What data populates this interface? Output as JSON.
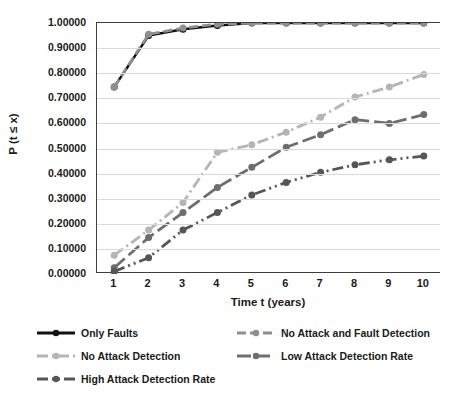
{
  "chart_data": {
    "type": "line",
    "title": "",
    "xlabel": "Time t (years)",
    "ylabel": "P (t ≤ x)",
    "grid": true,
    "legend_position": "bottom",
    "x": [
      1,
      2,
      3,
      4,
      5,
      6,
      7,
      8,
      9,
      10
    ],
    "xtick_labels": [
      "1",
      "2",
      "3",
      "4",
      "5",
      "6",
      "7",
      "8",
      "9",
      "10"
    ],
    "xlim": [
      0.5,
      10.5
    ],
    "ylim": [
      0.0,
      1.0
    ],
    "ytick_labels": [
      "1.00000",
      "0.90000",
      "0.80000",
      "0.70000",
      "0.60000",
      "0.50000",
      "0.40000",
      "0.30000",
      "0.20000",
      "0.10000",
      "0.00000"
    ],
    "ytick_values": [
      1.0,
      0.9,
      0.8,
      0.7,
      0.6,
      0.5,
      0.4,
      0.3,
      0.2,
      0.1,
      0.0
    ],
    "series": [
      {
        "name": "Only Faults",
        "color": "#111111",
        "dash": "none",
        "marker": "circle",
        "values": [
          0.745,
          0.95,
          0.975,
          0.99,
          1.0,
          1.0,
          1.0,
          1.0,
          1.0,
          1.0
        ]
      },
      {
        "name": "No Attack and Fault Detection",
        "color": "#8f8f8f",
        "dash": "dashed",
        "marker": "circle",
        "values": [
          0.745,
          0.955,
          0.98,
          0.995,
          1.0,
          1.0,
          1.0,
          1.0,
          1.0,
          1.0
        ]
      },
      {
        "name": "No Attack Detection",
        "color": "#b5b5b5",
        "dash": "dashdot",
        "marker": "circle",
        "values": [
          0.075,
          0.175,
          0.285,
          0.485,
          0.515,
          0.565,
          0.625,
          0.705,
          0.745,
          0.795
        ]
      },
      {
        "name": "Low Attack Detection Rate",
        "color": "#6e6e6e",
        "dash": "longdash",
        "marker": "circle",
        "values": [
          0.025,
          0.145,
          0.245,
          0.345,
          0.425,
          0.505,
          0.555,
          0.615,
          0.6,
          0.635
        ]
      },
      {
        "name": "High Attack Detection Rate",
        "color": "#565656",
        "dash": "dashdotdot",
        "marker": "circle",
        "values": [
          0.01,
          0.065,
          0.175,
          0.245,
          0.315,
          0.365,
          0.405,
          0.435,
          0.455,
          0.47
        ]
      }
    ]
  },
  "legend": {
    "items": [
      {
        "label": "Only Faults"
      },
      {
        "label": "No Attack and Fault Detection"
      },
      {
        "label": "No Attack Detection"
      },
      {
        "label": "Low Attack Detection Rate"
      },
      {
        "label": "High Attack Detection Rate"
      }
    ]
  }
}
